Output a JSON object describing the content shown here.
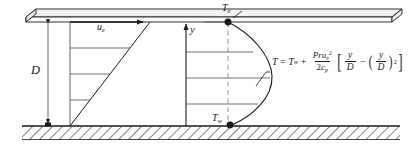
{
  "figure": {
    "labels": {
      "plate_gap": "D",
      "edge_velocity_base": "u",
      "edge_velocity_sub": "e",
      "vertical_axis": "y",
      "edge_temperature_base": "T",
      "edge_temperature_sub": "e",
      "wall_temperature_base": "T",
      "wall_temperature_sub": "w"
    },
    "equation": {
      "lhs": "T",
      "equals": "=",
      "wall_term_base": "T",
      "wall_term_sub": "w",
      "plus": "+",
      "numerator_pr": "Pr",
      "numerator_u": "u",
      "numerator_u_sub": "e",
      "numerator_u_sup": "2",
      "denominator_two": "2",
      "denominator_c": "c",
      "denominator_c_sub": "p",
      "bracket_open": "[",
      "term1_num": "y",
      "term1_den": "D",
      "minus": "−",
      "paren_open": "(",
      "term2_num": "y",
      "term2_den": "D",
      "paren_close": ")",
      "term2_exp": "2",
      "bracket_close": "]"
    },
    "colors": {
      "line": "#1a1a1a",
      "plate_fill": "#f2f2f2",
      "hatch": "#1a1a1a",
      "dash": "#777777",
      "background": "#ffffff"
    },
    "geometry": {
      "plate_top_y": 14,
      "wall_y": 126,
      "velocity_profile_x_left": 70,
      "velocity_profile_x_right": 150,
      "temperature_axis_x": 228,
      "temperature_peak_x": 272
    }
  }
}
